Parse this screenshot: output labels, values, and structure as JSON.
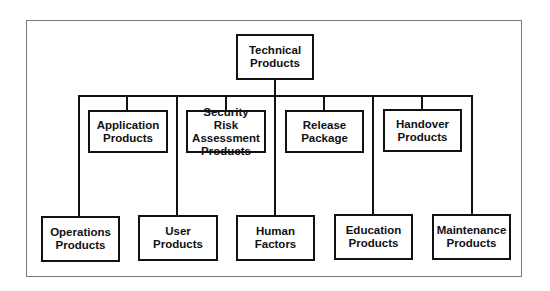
{
  "diagram": {
    "root": {
      "label": "Technical\nProducts"
    },
    "upper_row": [
      {
        "label": "Application\nProducts"
      },
      {
        "label": "Security Risk\nAssessment\nProducts"
      },
      {
        "label": "Release\nPackage"
      },
      {
        "label": "Handover\nProducts"
      }
    ],
    "lower_row": [
      {
        "label": "Operations\nProducts"
      },
      {
        "label": "User\nProducts"
      },
      {
        "label": "Human\nFactors"
      },
      {
        "label": "Education\nProducts"
      },
      {
        "label": "Maintenance\nProducts"
      }
    ]
  }
}
